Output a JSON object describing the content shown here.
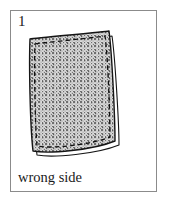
{
  "figure": {
    "step_number": "1",
    "caption": "wrong side",
    "frame": {
      "border_color": "#8b8b8b",
      "background_color": "#ffffff"
    }
  },
  "illustration": {
    "name": "fabric-square-wrong-side",
    "description": "A square piece of fabric shown wrong side up, with a dashed stitching line running just inside all four edges",
    "colors": {
      "outline": "#111111",
      "fabric_fill": "#d9d9d9",
      "stipple_dot": "#6e6e6e",
      "underside_fill": "#ffffff",
      "stitch_line": "#111111"
    },
    "elements": [
      {
        "name": "fabric-underside-edge",
        "label": "right side / underside sliver visible along right and bottom edges",
        "fill": "#ffffff"
      },
      {
        "name": "fabric-main-panel",
        "label": "wrong side of fabric, stippled texture",
        "fill": "#d9d9d9"
      },
      {
        "name": "stitch-line",
        "label": "dashed basting / stitching line",
        "style": "dashed",
        "color": "#111111"
      }
    ]
  }
}
